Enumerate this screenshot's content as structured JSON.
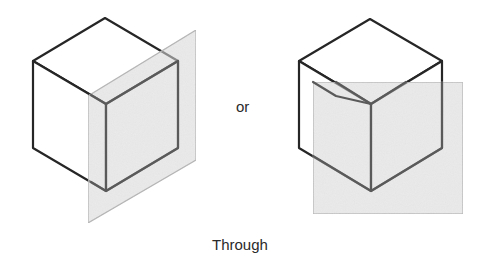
{
  "diagram": {
    "title": "Through",
    "separator": "or",
    "caption": "Through",
    "colors": {
      "background": "#ffffff",
      "cube_edge_front": "#262626",
      "cube_edge_in_plane": "#5a5a5a",
      "plane_fill": "#d9d9d9",
      "plane_edge": "#b5b5b5",
      "text": "#2a2a2a"
    },
    "figures": [
      {
        "id": "left",
        "description": "Cube with a vertical oblique plane passing through its front vertical edge",
        "cube": {
          "top": [
            105,
            18
          ],
          "upper_left": [
            33,
            61
          ],
          "upper_right": [
            178,
            61
          ],
          "center": [
            106,
            104
          ],
          "lower_left": [
            33,
            148
          ],
          "lower_right": [
            178,
            148
          ],
          "bottom": [
            106,
            191
          ]
        },
        "plane": [
          [
            88,
            96
          ],
          [
            196,
            30
          ],
          [
            196,
            160
          ],
          [
            88,
            223
          ]
        ]
      },
      {
        "id": "right",
        "description": "Cube with a frontal rectangular plane passing through its front vertical edge",
        "cube": {
          "top": [
            370,
            19
          ],
          "upper_left": [
            299,
            61
          ],
          "upper_right": [
            442,
            61
          ],
          "center": [
            371,
            104
          ],
          "lower_left": [
            299,
            148
          ],
          "lower_right": [
            442,
            148
          ],
          "bottom": [
            371,
            191
          ]
        },
        "plane": [
          [
            313,
            82
          ],
          [
            463,
            82
          ],
          [
            463,
            214
          ],
          [
            313,
            214
          ]
        ]
      }
    ]
  }
}
